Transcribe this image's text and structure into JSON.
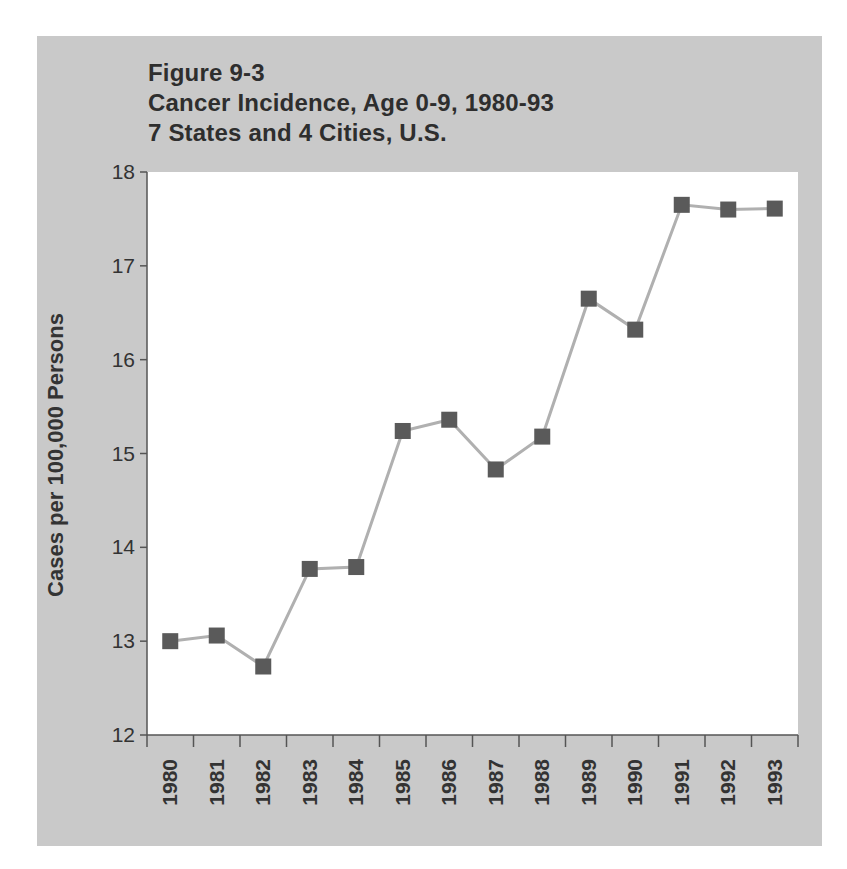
{
  "figure": {
    "label": "Figure 9-3",
    "title": "Cancer Incidence, Age 0-9, 1980-93",
    "subtitle": "7 States and 4 Cities, U.S."
  },
  "axes": {
    "ylabel": "Cases per 100,000 Persons",
    "yticks": [
      "12",
      "13",
      "14",
      "15",
      "16",
      "17",
      "18"
    ],
    "xticks": [
      "1980",
      "1981",
      "1982",
      "1983",
      "1984",
      "1985",
      "1986",
      "1987",
      "1988",
      "1989",
      "1990",
      "1991",
      "1992",
      "1993"
    ]
  },
  "colors": {
    "panel_bg": "#c9c9c9",
    "plot_bg": "#ffffff",
    "line": "#b0b0b0",
    "marker": "#5a5a5a",
    "text": "#2e2e2e"
  },
  "chart_data": {
    "type": "line",
    "title": "Figure 9-3 Cancer Incidence, Age 0-9, 1980-93 7 States and 4 Cities, U.S.",
    "xlabel": "",
    "ylabel": "Cases per 100,000 Persons",
    "categories": [
      "1980",
      "1981",
      "1982",
      "1983",
      "1984",
      "1985",
      "1986",
      "1987",
      "1988",
      "1989",
      "1990",
      "1991",
      "1992",
      "1993"
    ],
    "series": [
      {
        "name": "Cancer incidence, age 0-9",
        "values": [
          13.0,
          13.06,
          12.73,
          13.77,
          13.79,
          15.24,
          15.36,
          14.83,
          15.18,
          16.65,
          16.32,
          17.65,
          17.6,
          17.61
        ]
      }
    ],
    "ylim": [
      12,
      18
    ],
    "yticks": [
      12,
      13,
      14,
      15,
      16,
      17,
      18
    ],
    "grid": false,
    "legend": "none",
    "marker": "square"
  }
}
